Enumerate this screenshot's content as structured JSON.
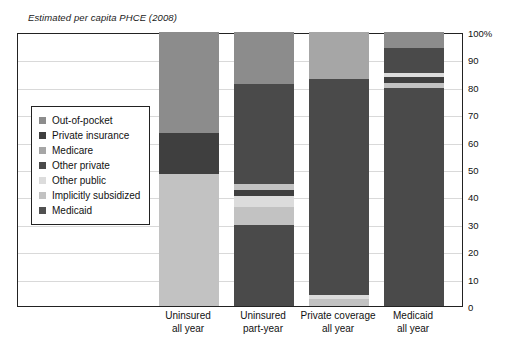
{
  "caption": "Estimated per capita PHCE (2008)",
  "legend": {
    "items": [
      {
        "label": "Out-of-pocket",
        "color": "#8c8c8c",
        "key": "out_of_pocket"
      },
      {
        "label": "Private insurance",
        "color": "#3f3f3f",
        "key": "private_insurance"
      },
      {
        "label": "Medicare",
        "color": "#a6a6a6",
        "key": "medicare"
      },
      {
        "label": "Other private",
        "color": "#4a4a4a",
        "key": "other_private"
      },
      {
        "label": "Other public",
        "color": "#dcdcdc",
        "key": "other_public"
      },
      {
        "label": "Implicitly subsidized",
        "color": "#c2c2c2",
        "key": "implicitly_subsidized"
      },
      {
        "label": "Medicaid",
        "color": "#505050",
        "key": "medicaid"
      }
    ]
  },
  "axis": {
    "y_ticks": [
      "100%",
      "90",
      "80",
      "70",
      "60",
      "50",
      "40",
      "30",
      "20",
      "10",
      "0"
    ],
    "y_values": [
      100,
      90,
      80,
      70,
      60,
      50,
      40,
      30,
      20,
      10,
      0
    ],
    "y_min": 0,
    "y_max": 100
  },
  "chart_data": {
    "type": "bar",
    "title": "Estimated per capita PHCE (2008)",
    "subtitle": "",
    "xlabel": "",
    "ylabel": "",
    "ylim": [
      0,
      100
    ],
    "stacked": true,
    "grid": true,
    "legend_position": "inside-left",
    "categories": [
      "Uninsured all year",
      "Uninsured part-year",
      "Private coverage all year",
      "Medicaid all year"
    ],
    "category_lines": [
      [
        "Uninsured",
        "all year"
      ],
      [
        "Uninsured",
        "part-year"
      ],
      [
        "Private coverage",
        "all year"
      ],
      [
        "Medicaid",
        "all year"
      ]
    ],
    "series": [
      {
        "name": "Out-of-pocket",
        "color": "#8c8c8c",
        "values": [
          37.0,
          12.0,
          15.0,
          6.0
        ]
      },
      {
        "name": "Private insurance",
        "color": "#3f3f3f",
        "values": [
          0.0,
          0.0,
          0.0,
          0.0
        ]
      },
      {
        "name": "Medicare",
        "color": "#a6a6a6",
        "values": [
          0.0,
          0.0,
          0.0,
          0.0
        ]
      },
      {
        "name": "Other private",
        "color": "#4a4a4a",
        "values": [
          15.0,
          43.5,
          79.0,
          11.0
        ]
      },
      {
        "name": "Other public",
        "color": "#dcdcdc",
        "values": [
          0.0,
          3.5,
          0.0,
          1.5
        ]
      },
      {
        "name": "Implicitly subsidized",
        "color": "#c2c2c2",
        "values": [
          48.0,
          4.0,
          2.5,
          2.0
        ]
      },
      {
        "name": "Medicaid",
        "color": "#505050",
        "values": [
          0.0,
          37.0,
          3.5,
          79.5
        ]
      }
    ],
    "bars": [
      {
        "category": "Uninsured all year",
        "segments": [
          {
            "series": "Implicitly subsidized",
            "color": "#c2c2c2",
            "value": 48.0,
            "y0": 0.0,
            "y1": 48.0
          },
          {
            "series": "Other private",
            "color": "#3f3f3f",
            "value": 15.0,
            "y0": 48.0,
            "y1": 63.0
          },
          {
            "series": "Out-of-pocket",
            "color": "#8c8c8c",
            "value": 37.0,
            "y0": 63.0,
            "y1": 100.0
          }
        ]
      },
      {
        "category": "Uninsured part-year",
        "segments": [
          {
            "series": "Medicaid",
            "color": "#4a4a4a",
            "value": 29.5,
            "y0": 0.0,
            "y1": 29.5
          },
          {
            "series": "Implicitly subsidized",
            "color": "#c2c2c2",
            "value": 6.5,
            "y0": 29.5,
            "y1": 36.0
          },
          {
            "series": "Other public",
            "color": "#dcdcdc",
            "value": 4.0,
            "y0": 36.0,
            "y1": 40.0
          },
          {
            "series": "Other private",
            "color": "#3f3f3f",
            "value": 2.5,
            "y0": 40.0,
            "y1": 42.5
          },
          {
            "series": "Implicitly subsidized",
            "color": "#c2c2c2",
            "value": 2.0,
            "y0": 42.5,
            "y1": 44.5
          },
          {
            "series": "Private insurance",
            "color": "#4a4a4a",
            "value": 36.5,
            "y0": 44.5,
            "y1": 81.0
          },
          {
            "series": "Out-of-pocket",
            "color": "#8c8c8c",
            "value": 19.0,
            "y0": 81.0,
            "y1": 100.0
          }
        ]
      },
      {
        "category": "Private coverage all year",
        "segments": [
          {
            "series": "Implicitly subsidized",
            "color": "#c2c2c2",
            "value": 2.5,
            "y0": 0.0,
            "y1": 2.5
          },
          {
            "series": "Other public",
            "color": "#dcdcdc",
            "value": 1.5,
            "y0": 2.5,
            "y1": 4.0
          },
          {
            "series": "Private insurance",
            "color": "#4a4a4a",
            "value": 79.0,
            "y0": 4.0,
            "y1": 83.0
          },
          {
            "series": "Out-of-pocket",
            "color": "#a6a6a6",
            "value": 17.0,
            "y0": 83.0,
            "y1": 100.0
          }
        ]
      },
      {
        "category": "Medicaid all year",
        "segments": [
          {
            "series": "Medicaid",
            "color": "#4a4a4a",
            "value": 79.5,
            "y0": 0.0,
            "y1": 79.5
          },
          {
            "series": "Implicitly subsidized",
            "color": "#c2c2c2",
            "value": 2.0,
            "y0": 79.5,
            "y1": 81.5
          },
          {
            "series": "Other private",
            "color": "#3f3f3f",
            "value": 2.0,
            "y0": 81.5,
            "y1": 83.5
          },
          {
            "series": "Other public",
            "color": "#dcdcdc",
            "value": 1.5,
            "y0": 83.5,
            "y1": 85.0
          },
          {
            "series": "Private insurance",
            "color": "#4a4a4a",
            "value": 9.0,
            "y0": 85.0,
            "y1": 94.0
          },
          {
            "series": "Out-of-pocket",
            "color": "#8c8c8c",
            "value": 6.0,
            "y0": 94.0,
            "y1": 100.0
          }
        ]
      }
    ]
  }
}
